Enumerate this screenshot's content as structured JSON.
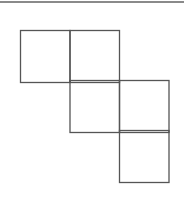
{
  "figure": {
    "type": "square-net",
    "line_color": "#555555",
    "rule_color": "#8a8a8a",
    "square_size": 49,
    "squares": [
      {
        "row": 0,
        "col": 0
      },
      {
        "row": 0,
        "col": 1
      },
      {
        "row": 1,
        "col": 1
      },
      {
        "row": 1,
        "col": 2
      },
      {
        "row": 2,
        "col": 2
      }
    ],
    "origin": {
      "x": 20.5,
      "y": 30.5
    },
    "cell": 49.5
  }
}
